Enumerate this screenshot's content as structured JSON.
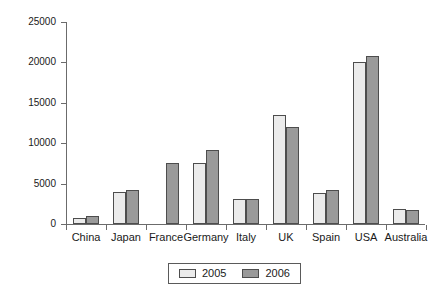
{
  "chart_data": {
    "type": "bar",
    "title": "",
    "subtitle": "",
    "xlabel": "",
    "ylabel": "",
    "ylim": [
      0,
      25000
    ],
    "yticks": [
      0,
      5000,
      10000,
      15000,
      20000,
      25000
    ],
    "ytick_labels": [
      "0",
      "5000",
      "10000",
      "15000",
      "20000",
      "25000"
    ],
    "grid": false,
    "legend_position": "bottom-center",
    "categories": [
      "China",
      "Japan",
      "France",
      "Germany",
      "Italy",
      "UK",
      "Spain",
      "USA",
      "Australia"
    ],
    "series": [
      {
        "name": "2005",
        "color": "#ebebeb",
        "values": [
          800,
          4000,
          null,
          7500,
          3050,
          13500,
          3800,
          20050,
          1800
        ]
      },
      {
        "name": "2006",
        "color": "#9a9a9a",
        "values": [
          1000,
          4150,
          7600,
          9150,
          3150,
          12050,
          4200,
          20800,
          1700
        ]
      }
    ]
  },
  "legend": {
    "entries": [
      {
        "label": "2005",
        "swatch": "light-gray-swatch"
      },
      {
        "label": "2006",
        "swatch": "dark-gray-swatch"
      }
    ]
  },
  "axis": {
    "y_tick_labels": [
      "25000",
      "20000",
      "15000",
      "10000",
      "5000",
      "0"
    ],
    "x_tick_labels": [
      "China",
      "Japan",
      "France",
      "Germany",
      "Italy",
      "UK",
      "Spain",
      "USA",
      "Australia"
    ]
  },
  "colors": {
    "series_2005": "#ebebeb",
    "series_2006": "#9a9a9a",
    "bar_border": "#4d4d4d",
    "axis": "#6b6b6b",
    "text": "#1a1a1a",
    "background": "#ffffff"
  }
}
